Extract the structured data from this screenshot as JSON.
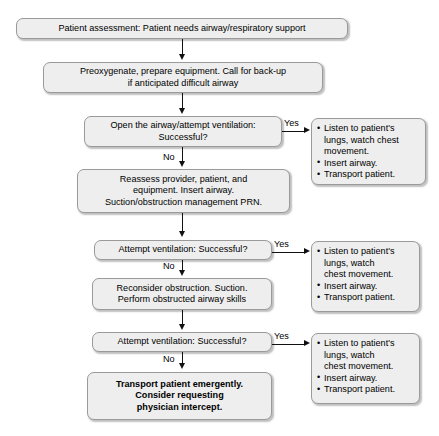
{
  "diagram": {
    "type": "flowchart",
    "colors": {
      "box_fill": "#eeeeee",
      "box_border": "#9a9a9a",
      "connector": "#111111",
      "text": "#000000",
      "background": "#ffffff"
    },
    "nodes": {
      "assessment": "Patient assessment: Patient needs airway/respiratory support",
      "preoxygenate": "Preoxygenate, prepare equipment. Call for back-up\nif anticipated difficult airway",
      "decision1": "Open the airway/attempt ventilation:\nSuccessful?",
      "reassess": "Reassess provider, patient, and\nequipment. Insert airway.\nSuction/obstruction management PRN.",
      "decision2": "Attempt ventilation: Successful?",
      "reconsider": "Reconsider obstruction. Suction.\nPerform obstructed airway skills",
      "decision3": "Attempt ventilation:  Successful?",
      "transport": "Transport patient emergently.\nConsider requesting\nphysician intercept."
    },
    "outcome1": {
      "bullets": [
        "Listen to patient's\nlungs, watch chest\nmovement.",
        "Insert airway.",
        "Transport patient."
      ]
    },
    "outcome2": {
      "bullets": [
        "Listen to patient's\nlungs, watch\nchest movement.",
        "Insert airway.",
        "Transport patient."
      ]
    },
    "outcome3": {
      "bullets": [
        "Listen to patient's\nlungs, watch\nchest movement.",
        "Insert airway.",
        "Transport patient."
      ]
    },
    "edges": {
      "yes1": "Yes",
      "no1": "No",
      "yes2": "Yes",
      "no2": "No",
      "yes3": "Yes",
      "no3": "No"
    }
  }
}
